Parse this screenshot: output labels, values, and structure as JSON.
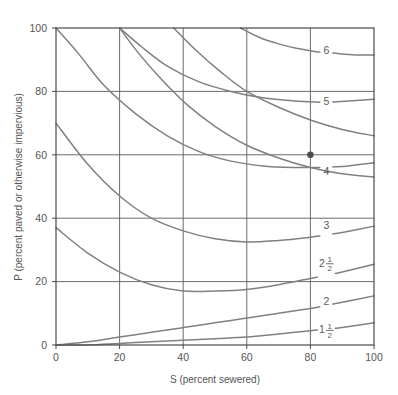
{
  "chart_data": {
    "type": "line",
    "title": "",
    "xlabel": "S (percent sewered)",
    "ylabel": "P (percent paved or otherwise impervious)",
    "xlim": [
      0,
      100
    ],
    "ylim": [
      0,
      100
    ],
    "xticks": [
      "0",
      "20",
      "40",
      "60",
      "80",
      "100"
    ],
    "yticks": [
      "0",
      "20",
      "40",
      "60",
      "80",
      "100"
    ],
    "xtick_values": [
      0,
      20,
      40,
      60,
      80,
      100
    ],
    "ytick_values": [
      0,
      20,
      40,
      60,
      80,
      100
    ],
    "grid": true,
    "grid_spacing": 20,
    "legend": "none",
    "legend_position": "inline-curve-labels",
    "curve_label_style": "value at right end of each curve",
    "series": [
      {
        "name": "1 1/2",
        "label_text": "1",
        "label_fraction_num": "1",
        "label_fraction_den": "2",
        "has_fraction": true,
        "label_x": 85,
        "label_y": 5,
        "points": [
          [
            0,
            0
          ],
          [
            10,
            0
          ],
          [
            20,
            0.5
          ],
          [
            30,
            1
          ],
          [
            40,
            1.5
          ],
          [
            50,
            2
          ],
          [
            60,
            2.5
          ],
          [
            70,
            3.5
          ],
          [
            80,
            4.5
          ],
          [
            90,
            5.5
          ],
          [
            100,
            7
          ]
        ]
      },
      {
        "name": "2",
        "label_text": "2",
        "has_fraction": false,
        "label_x": 85,
        "label_y": 14,
        "points": [
          [
            0,
            0
          ],
          [
            10,
            1
          ],
          [
            20,
            2.5
          ],
          [
            30,
            4
          ],
          [
            40,
            5.5
          ],
          [
            50,
            7
          ],
          [
            60,
            8.5
          ],
          [
            70,
            10
          ],
          [
            80,
            11.5
          ],
          [
            90,
            13.5
          ],
          [
            100,
            15.5
          ]
        ]
      },
      {
        "name": "2 1/2",
        "label_text": "2",
        "label_fraction_num": "1",
        "label_fraction_den": "2",
        "has_fraction": true,
        "label_x": 85,
        "label_y": 26,
        "points": [
          [
            0,
            37
          ],
          [
            10,
            29
          ],
          [
            20,
            23
          ],
          [
            30,
            19
          ],
          [
            40,
            17
          ],
          [
            50,
            17
          ],
          [
            60,
            17.5
          ],
          [
            70,
            19
          ],
          [
            80,
            21
          ],
          [
            90,
            23
          ],
          [
            100,
            25.5
          ]
        ]
      },
      {
        "name": "3",
        "label_text": "3",
        "has_fraction": false,
        "label_x": 85,
        "label_y": 38,
        "points": [
          [
            0,
            70
          ],
          [
            10,
            57
          ],
          [
            20,
            47
          ],
          [
            30,
            40
          ],
          [
            40,
            36
          ],
          [
            50,
            33.5
          ],
          [
            60,
            32.5
          ],
          [
            70,
            33
          ],
          [
            80,
            34
          ],
          [
            90,
            35.5
          ],
          [
            100,
            37.5
          ]
        ]
      },
      {
        "name": "4",
        "label_text": "4",
        "has_fraction": false,
        "label_x": 85,
        "label_y": 55,
        "points": [
          [
            0,
            100
          ],
          [
            7,
            92
          ],
          [
            15,
            82
          ],
          [
            25,
            73
          ],
          [
            35,
            66
          ],
          [
            45,
            61
          ],
          [
            55,
            58
          ],
          [
            65,
            56.5
          ],
          [
            75,
            56
          ],
          [
            85,
            56
          ],
          [
            92,
            56.5
          ],
          [
            100,
            57.5
          ]
        ]
      },
      {
        "name": "5",
        "label_text": "5",
        "has_fraction": false,
        "label_x": 85,
        "label_y": 77,
        "points": [
          [
            20,
            100
          ],
          [
            27,
            94
          ],
          [
            35,
            88
          ],
          [
            45,
            83
          ],
          [
            55,
            80
          ],
          [
            65,
            78
          ],
          [
            75,
            77
          ],
          [
            85,
            76.5
          ],
          [
            92,
            77
          ],
          [
            100,
            77.5
          ]
        ]
      },
      {
        "name": "6",
        "label_text": "6",
        "has_fraction": false,
        "label_x": 85,
        "label_y": 93,
        "points": [
          [
            58,
            100
          ],
          [
            64,
            97
          ],
          [
            70,
            95
          ],
          [
            76,
            93.5
          ],
          [
            82,
            92.5
          ],
          [
            88,
            92
          ],
          [
            94,
            91.5
          ],
          [
            100,
            91.5
          ]
        ]
      },
      {
        "name": "unlabeled-upper-a",
        "label_text": "",
        "has_fraction": false,
        "label_x": null,
        "label_y": null,
        "points": [
          [
            37,
            100
          ],
          [
            44,
            93
          ],
          [
            52,
            86
          ],
          [
            60,
            80
          ],
          [
            70,
            75
          ],
          [
            80,
            71
          ],
          [
            90,
            68
          ],
          [
            100,
            66
          ]
        ]
      },
      {
        "name": "unlabeled-upper-b",
        "label_text": "",
        "has_fraction": false,
        "label_x": null,
        "label_y": null,
        "points": [
          [
            20,
            100
          ],
          [
            26,
            92
          ],
          [
            33,
            84
          ],
          [
            41,
            76
          ],
          [
            50,
            69
          ],
          [
            60,
            63
          ],
          [
            70,
            59
          ],
          [
            80,
            56
          ],
          [
            90,
            54
          ],
          [
            100,
            53
          ]
        ]
      }
    ],
    "markers": [
      {
        "name": "operating-point",
        "x": 80,
        "y": 60,
        "style": "filled-circle",
        "color": "#4a4a4a"
      }
    ],
    "colors": {
      "curve": "#808080",
      "grid": "#5a5a5a",
      "axis": "#4a4a4a",
      "text": "#555555",
      "background": "#ffffff",
      "marker": "#4a4a4a"
    }
  }
}
